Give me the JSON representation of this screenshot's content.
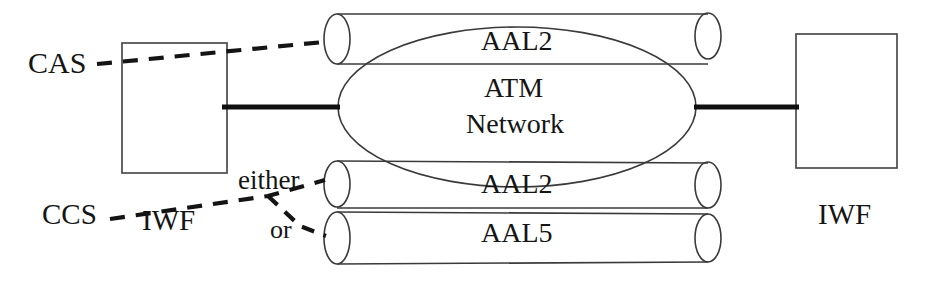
{
  "diagram": {
    "colors": {
      "stroke": "#3a3a3a",
      "thick_link": "#101010",
      "dashed": "#141414",
      "text": "#151515",
      "background": "#ffffff"
    },
    "nodes": {
      "left_box": {
        "label": "IWF",
        "x": 122,
        "y": 43,
        "width": 105,
        "height": 130
      },
      "right_box": {
        "label": "IWF",
        "x": 796,
        "y": 34,
        "width": 101,
        "height": 134
      },
      "cloud": {
        "line1": "ATM",
        "line2": "Network",
        "cx": 517,
        "cy": 107,
        "rx": 179,
        "ry": 80
      }
    },
    "pipes": [
      {
        "name": "pipe-aal2-top",
        "label": "AAL2",
        "x": 325,
        "y": 14,
        "width": 395,
        "height": 50
      },
      {
        "name": "pipe-aal2-middle",
        "label": "AAL2",
        "x": 325,
        "y": 161,
        "width": 395,
        "height": 47
      },
      {
        "name": "pipe-aal5-bottom",
        "label": "AAL5",
        "x": 325,
        "y": 212,
        "width": 395,
        "height": 52
      }
    ],
    "signal_labels": {
      "cas": "CAS",
      "ccs": "CCS",
      "either": "either",
      "or": "or"
    },
    "connectors": {
      "cas_dashed": "CAS dashed line from left label, over IWF box, to top AAL2 pipe",
      "ccs_dashed": "CCS dashed line branching to either AAL2 pipe or AAL5 pipe",
      "left_trunk": "thick solid link from left IWF box to ATM Network cloud",
      "right_trunk": "thick solid link from ATM Network cloud to right IWF box"
    }
  }
}
